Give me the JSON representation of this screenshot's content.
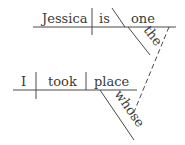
{
  "diagram": {
    "type": "sentence-diagram",
    "main_clause": {
      "subject": "Jessica",
      "verb": "is",
      "predicate_nominative": "one",
      "modifiers": [
        {
          "word": "the",
          "modifies": "one"
        }
      ]
    },
    "relative_clause": {
      "subject": "I",
      "verb": "took",
      "direct_object": "place",
      "modifiers": [
        {
          "word": "whose",
          "modifies": "place"
        }
      ]
    },
    "connector": {
      "from": "one",
      "to": "whose",
      "style": "dashed"
    }
  },
  "words": {
    "jessica": "Jessica",
    "is": "is",
    "one": "one",
    "the": "the",
    "i": "I",
    "took": "took",
    "place": "place",
    "whose": "whose"
  },
  "colors": {
    "ink": "#3a3a3a",
    "background": "#ffffff"
  }
}
